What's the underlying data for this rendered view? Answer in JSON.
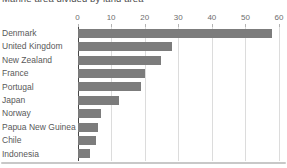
{
  "title": "Marine area divided by land area",
  "colors": {
    "bar": "#7c7c7c",
    "axis_line": "#474747",
    "gridline": "#dcdcdc",
    "category_label": "#595959",
    "tick_label": "#6e6e6e",
    "title": "#4d4d4d",
    "divider": "#c8c8c8",
    "background": "#ffffff"
  },
  "chart_data": {
    "type": "bar",
    "orientation": "horizontal",
    "title": "Marine area divided by land area",
    "categories": [
      "Denmark",
      "United Kingdom",
      "New Zealand",
      "France",
      "Portugal",
      "Japan",
      "Norway",
      "Papua New Guinea",
      "Chile",
      "Indonesia"
    ],
    "values": [
      58,
      28,
      25,
      20,
      19,
      12.5,
      7,
      6,
      5.5,
      3.7
    ],
    "xlabel": "",
    "ylabel": "",
    "xlim": [
      0,
      60
    ],
    "xticks": [
      0,
      10,
      20,
      30,
      40,
      50,
      60
    ],
    "grid": true,
    "legend": false
  }
}
